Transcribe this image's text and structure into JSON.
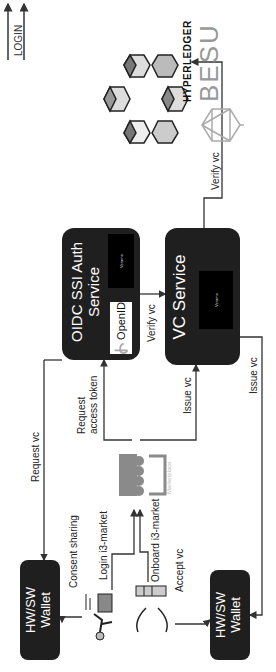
{
  "legend": {
    "items": [
      {
        "label": "ONBOARDING"
      },
      {
        "label": "LOGIN"
      }
    ]
  },
  "blockchain": {
    "icon": "cube-network-icon",
    "brand_top": "HYPERLEDGER",
    "brand_bottom": "BESU"
  },
  "oidc_service": {
    "title_line1": "OIDC SSI Auth",
    "title_line2": "Service",
    "openid_label": "OpenID",
    "veramo_label": "Veramo"
  },
  "vc_service": {
    "title": "VC Service",
    "veramo_label": "Veramo"
  },
  "marketplace": {
    "label": "Marketplace"
  },
  "wallet_login": {
    "title_line1": "HW/SW",
    "title_line2": "Wallet"
  },
  "wallet_onboard": {
    "title_line1": "HW/SW",
    "title_line2": "Wallet"
  },
  "edges": {
    "request_vc": "Request vc",
    "request_access_token_line1": "Request",
    "request_access_token_line2": "access token",
    "verify_vc_oidc": "Verify vc",
    "verify_vc_chain": "Verify vc",
    "issue_vc_market": "Issue vc",
    "issue_vc_wallet": "Issue vc",
    "consent_sharing": "Consent sharing",
    "login_i3market": "Login i3-market",
    "onboard_i3market": "Onboard i3-market",
    "accept_vc": "Accept vc"
  },
  "colors": {
    "box_fill": "#1f1f1f",
    "line": "#333333",
    "market_gray": "#8a8a8a"
  }
}
